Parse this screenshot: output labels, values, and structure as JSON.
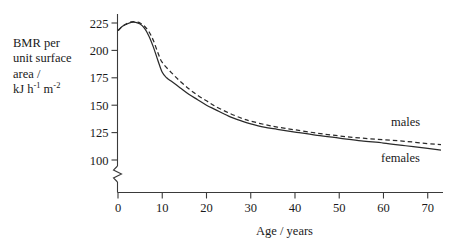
{
  "chart_data": {
    "type": "line",
    "title": "",
    "xlabel": "Age / years",
    "ylabel": "BMR per unit surface area / kJ h⁻¹ m⁻²",
    "ylabel_lines": [
      "BMR per",
      "unit surface",
      "area /",
      "kJ h m"
    ],
    "ylabel_unit_parts": {
      "quantity": "kJ",
      "h": "h",
      "h_exp": "-1",
      "m": "m",
      "m_exp": "-2"
    },
    "xlim": [
      0,
      73
    ],
    "ylim": [
      100,
      230
    ],
    "y_axis_break": true,
    "y_axis_break_note": "axis broken below 100",
    "grid": false,
    "xticks": [
      0,
      10,
      20,
      30,
      40,
      50,
      60,
      70
    ],
    "xtick_labels": [
      "0",
      "10",
      "20",
      "30",
      "40",
      "50",
      "60",
      "70"
    ],
    "yticks": [
      100,
      125,
      150,
      175,
      200,
      225
    ],
    "ytick_labels": [
      "100",
      "125",
      "150",
      "175",
      "200",
      "225"
    ],
    "legend_position": "inline-right",
    "series": [
      {
        "name": "males",
        "style": "dashed",
        "label": "males",
        "x": [
          0,
          1,
          2,
          3,
          4,
          5,
          6,
          7,
          8,
          9,
          10,
          12,
          14,
          16,
          18,
          20,
          22,
          25,
          28,
          30,
          33,
          36,
          40,
          45,
          50,
          55,
          60,
          65,
          70,
          73
        ],
        "values": [
          218,
          222,
          224.5,
          226,
          226,
          225,
          222,
          217,
          209,
          198,
          189,
          180,
          172,
          165,
          159,
          154,
          149,
          143,
          138,
          135.5,
          132.5,
          130,
          127.5,
          124.5,
          122,
          120,
          118.5,
          117,
          115,
          114
        ]
      },
      {
        "name": "females",
        "style": "solid",
        "label": "females",
        "x": [
          0,
          1,
          2,
          3,
          4,
          5,
          6,
          7,
          8,
          9,
          10,
          11,
          12,
          14,
          16,
          18,
          20,
          22,
          25,
          28,
          30,
          33,
          36,
          40,
          45,
          50,
          55,
          60,
          65,
          70,
          73
        ],
        "values": [
          218,
          222,
          224,
          225.5,
          225.5,
          224,
          220,
          213,
          203,
          191,
          180,
          175,
          172,
          166,
          160,
          155,
          150,
          146,
          140,
          135.5,
          133,
          130,
          128,
          125.5,
          122.5,
          120,
          117.5,
          115.5,
          113,
          110.5,
          109
        ]
      }
    ]
  }
}
